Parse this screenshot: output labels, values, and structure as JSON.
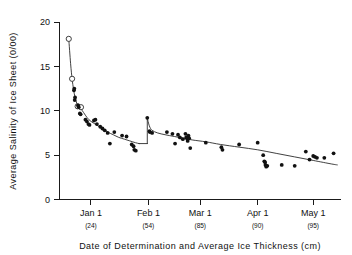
{
  "chart_data": {
    "type": "scatter",
    "title": "",
    "xlabel": "Date of Determination and Average Ice Thickness (cm)",
    "ylabel": "Average Salinity of Ice Sheet (0/00)",
    "ylim": [
      0,
      20
    ],
    "ytick_values": [
      0,
      5,
      10,
      15,
      20
    ],
    "ytick_labels": [
      "0",
      "5",
      "10",
      "15",
      "20"
    ],
    "grid": false,
    "legend": null,
    "x_axis_type": "date",
    "xlim_days": [
      -17,
      135
    ],
    "xticks": [
      {
        "label": "Jan 1",
        "sublabel": "(24)",
        "day": 0,
        "ice_thickness_cm": 24
      },
      {
        "label": "Feb 1",
        "sublabel": "(54)",
        "day": 31,
        "ice_thickness_cm": 54
      },
      {
        "label": "Mar 1",
        "sublabel": "(85)",
        "day": 59,
        "ice_thickness_cm": 85
      },
      {
        "label": "Apr 1",
        "sublabel": "(90)",
        "day": 90,
        "ice_thickness_cm": 90
      },
      {
        "label": "May 1",
        "sublabel": "(95)",
        "day": 120,
        "ice_thickness_cm": 95
      }
    ],
    "series": [
      {
        "name": "open-circle observations",
        "marker": "open-circle",
        "points": [
          {
            "day": -12.0,
            "salinity": 18.1
          },
          {
            "day": -10.2,
            "salinity": 13.6
          },
          {
            "day": -7.2,
            "salinity": 10.5
          },
          {
            "day": -5.4,
            "salinity": 10.4
          }
        ]
      },
      {
        "name": "filled-circle observations",
        "marker": "filled-circle",
        "points": [
          {
            "day": -9.0,
            "salinity": 12.5
          },
          {
            "day": -9.2,
            "salinity": 12.3
          },
          {
            "day": -8.6,
            "salinity": 11.5
          },
          {
            "day": -8.8,
            "salinity": 11.2
          },
          {
            "day": -7.0,
            "salinity": 10.6
          },
          {
            "day": -6.6,
            "salinity": 10.4
          },
          {
            "day": -6.0,
            "salinity": 9.7
          },
          {
            "day": -5.6,
            "salinity": 9.6
          },
          {
            "day": -3.0,
            "salinity": 9.0
          },
          {
            "day": -2.2,
            "salinity": 8.8
          },
          {
            "day": -1.4,
            "salinity": 8.5
          },
          {
            "day": -0.8,
            "salinity": 8.4
          },
          {
            "day": 1.6,
            "salinity": 8.9
          },
          {
            "day": 2.4,
            "salinity": 9.0
          },
          {
            "day": 3.2,
            "salinity": 8.5
          },
          {
            "day": 5.0,
            "salinity": 8.2
          },
          {
            "day": 6.2,
            "salinity": 8.0
          },
          {
            "day": 7.4,
            "salinity": 7.8
          },
          {
            "day": 9.0,
            "salinity": 7.5
          },
          {
            "day": 10.2,
            "salinity": 6.3
          },
          {
            "day": 12.6,
            "salinity": 7.6
          },
          {
            "day": 16.8,
            "salinity": 7.2
          },
          {
            "day": 19.2,
            "salinity": 7.1
          },
          {
            "day": 22.0,
            "salinity": 6.2
          },
          {
            "day": 23.0,
            "salinity": 6.0
          },
          {
            "day": 23.4,
            "salinity": 5.6
          },
          {
            "day": 24.2,
            "salinity": 5.5
          },
          {
            "day": 30.4,
            "salinity": 9.2
          },
          {
            "day": 31.6,
            "salinity": 7.7
          },
          {
            "day": 31.8,
            "salinity": 7.6
          },
          {
            "day": 33.0,
            "salinity": 7.5
          },
          {
            "day": 41.0,
            "salinity": 7.6
          },
          {
            "day": 44.0,
            "salinity": 7.4
          },
          {
            "day": 45.4,
            "salinity": 6.3
          },
          {
            "day": 47.0,
            "salinity": 7.3
          },
          {
            "day": 48.0,
            "salinity": 7.0
          },
          {
            "day": 49.6,
            "salinity": 6.8
          },
          {
            "day": 51.0,
            "salinity": 7.4
          },
          {
            "day": 51.4,
            "salinity": 7.0
          },
          {
            "day": 51.8,
            "salinity": 6.9
          },
          {
            "day": 52.2,
            "salinity": 6.6
          },
          {
            "day": 52.6,
            "salinity": 7.2
          },
          {
            "day": 53.0,
            "salinity": 6.9
          },
          {
            "day": 53.6,
            "salinity": 5.8
          },
          {
            "day": 62.0,
            "salinity": 6.4
          },
          {
            "day": 70.4,
            "salinity": 5.9
          },
          {
            "day": 71.0,
            "salinity": 5.6
          },
          {
            "day": 80.0,
            "salinity": 6.2
          },
          {
            "day": 90.0,
            "salinity": 6.4
          },
          {
            "day": 93.0,
            "salinity": 5.0
          },
          {
            "day": 93.6,
            "salinity": 4.3
          },
          {
            "day": 94.0,
            "salinity": 4.2
          },
          {
            "day": 94.2,
            "salinity": 3.9
          },
          {
            "day": 94.6,
            "salinity": 3.7
          },
          {
            "day": 95.2,
            "salinity": 3.8
          },
          {
            "day": 103.0,
            "salinity": 3.9
          },
          {
            "day": 110.0,
            "salinity": 3.8
          },
          {
            "day": 116.0,
            "salinity": 5.4
          },
          {
            "day": 118.0,
            "salinity": 4.5
          },
          {
            "day": 120.0,
            "salinity": 4.9
          },
          {
            "day": 121.0,
            "salinity": 4.8
          },
          {
            "day": 122.0,
            "salinity": 4.7
          },
          {
            "day": 126.0,
            "salinity": 4.7
          },
          {
            "day": 131.0,
            "salinity": 5.2
          }
        ]
      }
    ],
    "fit_curves": [
      {
        "name": "desalination-segment-1",
        "points": [
          {
            "day": -12.0,
            "salinity": 18.1
          },
          {
            "day": -11.0,
            "salinity": 15.3
          },
          {
            "day": -10.2,
            "salinity": 13.6
          },
          {
            "day": -9.4,
            "salinity": 12.4
          },
          {
            "day": -8.6,
            "salinity": 11.5
          },
          {
            "day": -7.6,
            "salinity": 10.8
          },
          {
            "day": -6.6,
            "salinity": 10.4
          },
          {
            "day": -5.4,
            "salinity": 10.2
          },
          {
            "day": -4.0,
            "salinity": 9.8
          },
          {
            "day": -2.0,
            "salinity": 9.2
          },
          {
            "day": 0.0,
            "salinity": 8.8
          },
          {
            "day": 3.0,
            "salinity": 8.4
          },
          {
            "day": 6.0,
            "salinity": 8.0
          },
          {
            "day": 9.0,
            "salinity": 7.6
          },
          {
            "day": 12.0,
            "salinity": 7.3
          },
          {
            "day": 15.0,
            "salinity": 7.0
          },
          {
            "day": 18.0,
            "salinity": 6.8
          },
          {
            "day": 21.0,
            "salinity": 6.6
          },
          {
            "day": 24.0,
            "salinity": 6.4
          },
          {
            "day": 26.0,
            "salinity": 6.3
          }
        ]
      },
      {
        "name": "desalination-segment-2",
        "points": [
          {
            "day": 30.4,
            "salinity": 9.2
          },
          {
            "day": 31.5,
            "salinity": 8.3
          },
          {
            "day": 33.0,
            "salinity": 7.8
          },
          {
            "day": 36.0,
            "salinity": 7.5
          },
          {
            "day": 40.0,
            "salinity": 7.3
          },
          {
            "day": 45.0,
            "salinity": 7.1
          },
          {
            "day": 50.0,
            "salinity": 6.9
          },
          {
            "day": 55.0,
            "salinity": 6.7
          },
          {
            "day": 62.0,
            "salinity": 6.5
          },
          {
            "day": 70.0,
            "salinity": 6.2
          },
          {
            "day": 80.0,
            "salinity": 5.9
          },
          {
            "day": 90.0,
            "salinity": 5.6
          },
          {
            "day": 100.0,
            "salinity": 5.2
          },
          {
            "day": 110.0,
            "salinity": 4.8
          },
          {
            "day": 120.0,
            "salinity": 4.4
          },
          {
            "day": 130.0,
            "salinity": 4.0
          },
          {
            "day": 133.0,
            "salinity": 3.9
          }
        ]
      }
    ]
  }
}
